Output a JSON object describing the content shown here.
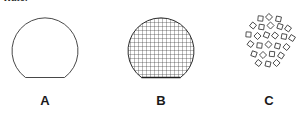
{
  "figure": {
    "caption_fragment": "Water",
    "background_color": "#ffffff",
    "stroke_color": "#333333",
    "label_color": "#1a1a1a",
    "panels": [
      {
        "label": "A",
        "shape_name": "truncated-disc-outline",
        "description": "Circle outline with flattened bottom chord, no fill",
        "fill": "none",
        "pattern": "none",
        "stroke_width": 0.9
      },
      {
        "label": "B",
        "shape_name": "truncated-disc-grid",
        "description": "Circle outline with flattened bottom chord, filled with fine square grid",
        "fill": "none",
        "pattern": "square-grid",
        "grid_pitch_px": 4,
        "stroke_width": 0.9
      },
      {
        "label": "C",
        "shape_name": "scattered-squares-cluster",
        "description": "Roughly circular cluster of small rotated square outlines",
        "fill": "none",
        "pattern": "scattered-squares",
        "square_count": 26,
        "square_size_px": 5,
        "stroke_width": 0.8
      }
    ]
  }
}
